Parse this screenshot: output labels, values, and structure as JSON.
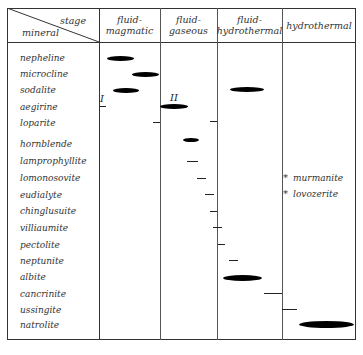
{
  "header": {
    "corner_top": "stage",
    "corner_bottom": "mineral",
    "stages": [
      "fluid-magmatic",
      "fluid-gaseous",
      "fluid-\nhydrothermal",
      "hydrothermal"
    ]
  },
  "minerals": [
    "nepheline",
    "microcline",
    "sodalite",
    "aegirine",
    "loparite",
    "hornblende",
    "lamprophyllite",
    "lomonosovite",
    "eudialyte",
    "chinglusuite",
    "villiaumite",
    "pectolite",
    "neptunite",
    "albite",
    "cancrinite",
    "ussingite",
    "natrolite"
  ],
  "generation_labels": {
    "first": "I",
    "second": "II"
  },
  "notes": [
    {
      "symbol": "*",
      "text": "murmanite"
    },
    {
      "symbol": "*",
      "text": "lovozerite"
    }
  ],
  "markers": [
    {
      "mineral": "nepheline",
      "type": "lens",
      "stage": "fluid-magmatic"
    },
    {
      "mineral": "microcline",
      "type": "lens",
      "stage": "fluid-magmatic"
    },
    {
      "mineral": "sodalite",
      "type": "lens",
      "stage": "fluid-magmatic"
    },
    {
      "mineral": "sodalite",
      "type": "lens",
      "stage": "fluid-hydrothermal"
    },
    {
      "mineral": "aegirine",
      "type": "dash",
      "stage": "fluid-magmatic",
      "generation": "I"
    },
    {
      "mineral": "aegirine",
      "type": "lens",
      "stage": "fluid-gaseous",
      "generation": "II"
    },
    {
      "mineral": "loparite",
      "type": "dash",
      "stage": "fluid-magmatic/fluid-gaseous boundary"
    },
    {
      "mineral": "loparite",
      "type": "dash",
      "stage": "fluid-gaseous/fluid-hydrothermal boundary"
    },
    {
      "mineral": "hornblende",
      "type": "lens",
      "stage": "fluid-gaseous"
    },
    {
      "mineral": "lamprophyllite",
      "type": "dash",
      "stage": "fluid-gaseous"
    },
    {
      "mineral": "lomonosovite",
      "type": "dash",
      "stage": "fluid-gaseous"
    },
    {
      "mineral": "eudialyte",
      "type": "dash",
      "stage": "fluid-gaseous"
    },
    {
      "mineral": "chinglusuite",
      "type": "dash",
      "stage": "fluid-gaseous"
    },
    {
      "mineral": "villiaumite",
      "type": "dash",
      "stage": "fluid-gaseous/fluid-hydrothermal"
    },
    {
      "mineral": "pectolite",
      "type": "dash",
      "stage": "fluid-hydrothermal"
    },
    {
      "mineral": "neptunite",
      "type": "dash",
      "stage": "fluid-hydrothermal"
    },
    {
      "mineral": "albite",
      "type": "lens",
      "stage": "fluid-hydrothermal"
    },
    {
      "mineral": "cancrinite",
      "type": "dash",
      "stage": "fluid-hydrothermal"
    },
    {
      "mineral": "ussingite",
      "type": "dash",
      "stage": "hydrothermal"
    },
    {
      "mineral": "natrolite",
      "type": "lens",
      "stage": "hydrothermal"
    }
  ]
}
